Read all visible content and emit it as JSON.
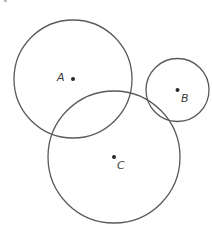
{
  "diagram": {
    "type": "circles",
    "stroke_color": "#5a5a5a",
    "dot_color": "#2a2a2a",
    "label_color": "#3a3a3a",
    "circles": [
      {
        "name": "A",
        "label": "A",
        "cx": 73,
        "cy": 79,
        "r": 59,
        "label_x": 57,
        "label_y": 81
      },
      {
        "name": "B",
        "label": "B",
        "cx": 177.5,
        "cy": 90,
        "r": 31.5,
        "label_x": 181,
        "label_y": 102
      },
      {
        "name": "C",
        "label": "C",
        "cx": 114,
        "cy": 157,
        "r": 66,
        "label_x": 117,
        "label_y": 169
      }
    ]
  }
}
